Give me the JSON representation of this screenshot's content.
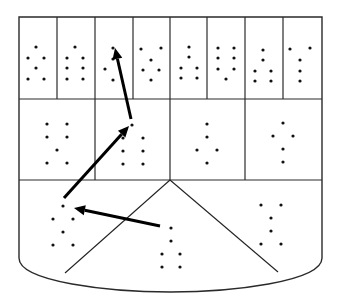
{
  "diagram": {
    "type": "shield-grid-with-dot-patterns",
    "colors": {
      "line": "#2a2a2a",
      "dot": "#111111",
      "arrow": "#000000",
      "background": "#ffffff"
    },
    "frame": {
      "left": 19,
      "right": 322,
      "top": 17,
      "row1_bottom": 99,
      "row2_bottom": 180,
      "straight_bottom": 262
    },
    "row1": {
      "columns_x": [
        19,
        57,
        95,
        133,
        170,
        207,
        245,
        283,
        322
      ],
      "cells": [
        {
          "dots": [
            [
              36,
              47
            ],
            [
              28,
              58
            ],
            [
              44,
              58
            ],
            [
              36,
              68
            ],
            [
              28,
              79
            ],
            [
              44,
              79
            ]
          ]
        },
        {
          "dots": [
            [
              75,
              47
            ],
            [
              67,
              58
            ],
            [
              83,
              58
            ],
            [
              67,
              68
            ],
            [
              83,
              68
            ],
            [
              67,
              79
            ],
            [
              83,
              79
            ]
          ]
        },
        {
          "dots": [
            [
              113,
              48
            ],
            [
              113,
              59
            ],
            [
              105,
              69
            ],
            [
              113,
              80
            ]
          ]
        },
        {
          "dots": [
            [
              141,
              49
            ],
            [
              161,
              48
            ],
            [
              151,
              60
            ],
            [
              143,
              70
            ],
            [
              159,
              70
            ],
            [
              151,
              80
            ]
          ]
        },
        {
          "dots": [
            [
              189,
              47
            ],
            [
              189,
              57
            ],
            [
              181,
              68
            ],
            [
              197,
              68
            ],
            [
              181,
              78
            ],
            [
              197,
              78
            ]
          ]
        },
        {
          "dots": [
            [
              218,
              48
            ],
            [
              234,
              48
            ],
            [
              218,
              58
            ],
            [
              234,
              58
            ],
            [
              218,
              69
            ],
            [
              234,
              69
            ],
            [
              226,
              79
            ]
          ]
        },
        {
          "dots": [
            [
              263,
              50
            ],
            [
              263,
              60
            ],
            [
              255,
              71
            ],
            [
              271,
              71
            ],
            [
              255,
              81
            ],
            [
              271,
              81
            ]
          ]
        },
        {
          "dots": [
            [
              290,
              49
            ],
            [
              310,
              48
            ],
            [
              300,
              60
            ],
            [
              300,
              71
            ],
            [
              300,
              81
            ]
          ]
        }
      ]
    },
    "row2": {
      "columns_x": [
        19,
        95,
        170,
        245,
        322
      ],
      "cells": [
        {
          "dots": [
            [
              47,
              124
            ],
            [
              67,
              124
            ],
            [
              47,
              137
            ],
            [
              67,
              137
            ],
            [
              57,
              150
            ],
            [
              47,
              163
            ],
            [
              67,
              163
            ]
          ]
        },
        {
          "dots": [
            [
              132,
              125
            ],
            [
              123,
              138
            ],
            [
              143,
              138
            ],
            [
              123,
              151
            ],
            [
              143,
              151
            ],
            [
              123,
              164
            ],
            [
              143,
              164
            ]
          ]
        },
        {
          "dots": [
            [
              207,
              124
            ],
            [
              207,
              137
            ],
            [
              197,
              150
            ],
            [
              217,
              150
            ],
            [
              207,
              163
            ]
          ]
        },
        {
          "dots": [
            [
              283,
              123
            ],
            [
              273,
              136
            ],
            [
              293,
              136
            ],
            [
              283,
              149
            ],
            [
              283,
              162
            ]
          ]
        }
      ]
    },
    "bottom": {
      "apex": [
        170,
        180
      ],
      "left_diagonal_end": [
        65,
        273
      ],
      "right_diagonal_end": [
        278,
        272
      ],
      "sections": [
        {
          "name": "left",
          "dots": [
            [
              63,
              206
            ],
            [
              53,
              219
            ],
            [
              73,
              219
            ],
            [
              63,
              232
            ],
            [
              53,
              245
            ],
            [
              73,
              245
            ]
          ]
        },
        {
          "name": "center",
          "dots": [
            [
              171,
              228
            ],
            [
              171,
              241
            ],
            [
              162,
              254
            ],
            [
              180,
              254
            ],
            [
              162,
              267
            ],
            [
              180,
              267
            ]
          ]
        },
        {
          "name": "right",
          "dots": [
            [
              261,
              205
            ],
            [
              281,
              205
            ],
            [
              271,
              218
            ],
            [
              271,
              231
            ],
            [
              261,
              244
            ],
            [
              281,
              244
            ]
          ]
        }
      ]
    },
    "arrows": [
      {
        "id": "arrow-1",
        "from": [
          160,
          226
        ],
        "to": [
          74,
          208
        ]
      },
      {
        "id": "arrow-2",
        "from": [
          64,
          198
        ],
        "to": [
          129,
          126
        ]
      },
      {
        "id": "arrow-3",
        "from": [
          131,
          119
        ],
        "to": [
          115,
          48
        ]
      }
    ]
  }
}
